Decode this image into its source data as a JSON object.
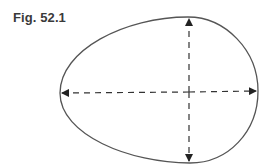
{
  "figure": {
    "label": "Fig. 52.1",
    "colors": {
      "outline": "#555555",
      "axes": "#333333",
      "label": "#3a3a3a",
      "background": "#ffffff"
    },
    "shape": {
      "type": "egg-outline",
      "top": [
        188,
        17
      ],
      "bottom": [
        190,
        163
      ],
      "left": [
        60,
        93
      ],
      "right": [
        258,
        91
      ]
    },
    "axes": [
      {
        "name": "vertical-axis",
        "from": [
          189,
          160
        ],
        "to": [
          189,
          19
        ],
        "style": "dashed",
        "arrowheads": "both"
      },
      {
        "name": "horizontal-axis",
        "from": [
          62,
          93
        ],
        "to": [
          256,
          91
        ],
        "style": "dashed",
        "arrowheads": "both"
      }
    ]
  }
}
